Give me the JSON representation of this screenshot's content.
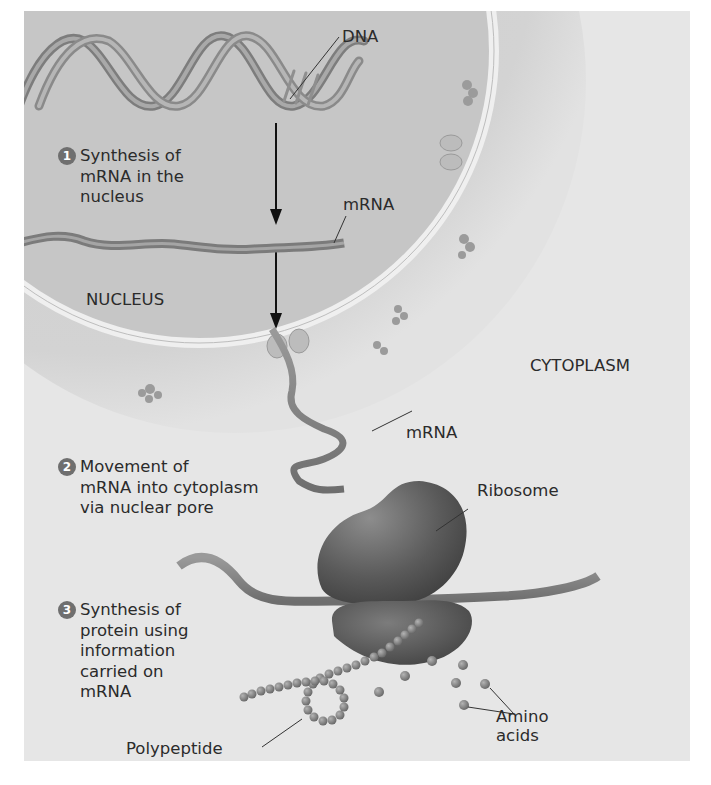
{
  "figure": {
    "colors": {
      "panel_bg": "#e6e6e6",
      "nucleus_fill": "#c9c9c9",
      "envelope": "#ececec",
      "cytoplasm_shadow": "#cfcfcf",
      "ribbon": "#8a8a8a",
      "ribosome": "#5e5e5e",
      "bead": "#7c7c7c",
      "text": "#2b2b2b"
    }
  },
  "labels": {
    "dna": "DNA",
    "mrna_nucleus": "mRNA",
    "nucleus": "NUCLEUS",
    "cytoplasm": "CYTOPLASM",
    "mrna_cytoplasm": "mRNA",
    "ribosome": "Ribosome",
    "polypeptide": "Polypeptide",
    "amino_acids": "Amino\nacids"
  },
  "steps": [
    {
      "number": "1",
      "text": "Synthesis of\nmRNA in the\nnucleus"
    },
    {
      "number": "2",
      "text": "Movement of\nmRNA into cytoplasm\nvia nuclear pore"
    },
    {
      "number": "3",
      "text": "Synthesis of\nprotein using\ninformation\ncarried on\nmRNA"
    }
  ]
}
